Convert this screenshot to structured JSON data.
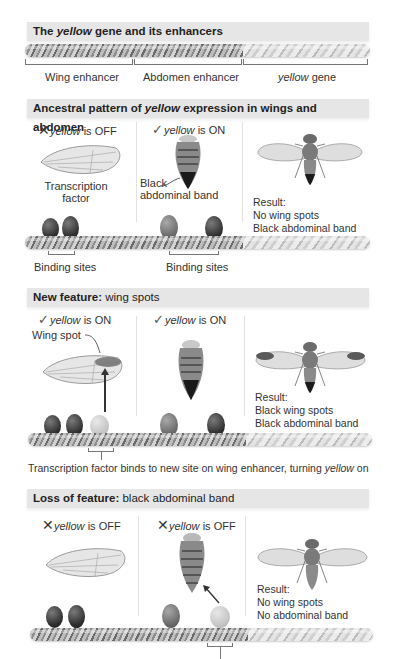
{
  "panel1": {
    "header_pre": "The ",
    "header_italic": "yellow",
    "header_post": " gene and its enhancers",
    "labels": {
      "wing_enhancer": "Wing enhancer",
      "abdomen_enhancer": "Abdomen enhancer",
      "gene_italic": "yellow",
      "gene_post": " gene"
    }
  },
  "panel2": {
    "header_pre": "Ancestral pattern of ",
    "header_italic": "yellow",
    "header_post": " expression in wings and abdomen",
    "wing_status": {
      "icon": "x-mark-icon",
      "glyph": "✕",
      "italic": "yellow",
      "text": " is OFF"
    },
    "abdomen_status": {
      "icon": "check-icon",
      "glyph": "✓",
      "italic": "yellow",
      "text": " is ON"
    },
    "transcription_factor_label_1": "Transcription",
    "transcription_factor_label_2": "factor",
    "black_band_label_1": "Black",
    "black_band_label_2": "abdominal band",
    "binding_sites_left": "Binding sites",
    "binding_sites_right": "Binding sites",
    "result": [
      "Result:",
      "No wing spots",
      "Black abdominal band"
    ]
  },
  "panel3": {
    "header_bold": "New feature:",
    "header_rest": " wing spots",
    "wing_status": {
      "icon": "check-icon",
      "glyph": "✓",
      "italic": "yellow",
      "text": " is ON"
    },
    "abdomen_status": {
      "icon": "check-icon",
      "glyph": "✓",
      "italic": "yellow",
      "text": " is ON"
    },
    "wing_spot_label": "Wing spot",
    "result": [
      "Result:",
      "Black wing spots",
      "Black abdominal band"
    ],
    "caption_pre": "Transcription factor binds to new site on wing enhancer, turning ",
    "caption_italic": "yellow",
    "caption_post": " on"
  },
  "panel4": {
    "header_bold": "Loss of feature:",
    "header_rest": " black abdominal band",
    "wing_status": {
      "icon": "x-mark-icon",
      "glyph": "✕",
      "italic": "yellow",
      "text": " is OFF"
    },
    "abdomen_status": {
      "icon": "x-mark-icon",
      "glyph": "✕",
      "italic": "yellow",
      "text": " is OFF"
    },
    "result": [
      "Result:",
      "No wing spots",
      "No abdominal band"
    ]
  },
  "colors": {
    "header_bg": "#e6e6e6",
    "tf_dark": "#2e2e2e",
    "tf_mid": "#6a6a6a",
    "tf_light": "#c4c4c4",
    "text": "#333333"
  }
}
